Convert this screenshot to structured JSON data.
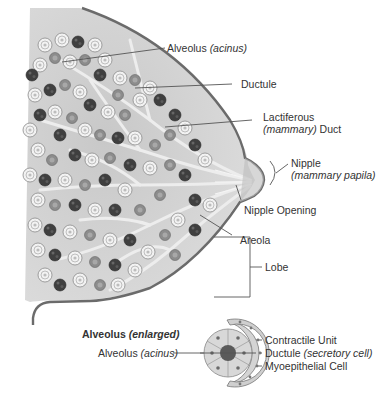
{
  "diagram": {
    "labels": {
      "alveolus": {
        "main": "Alveolus",
        "italic": "(acinus)"
      },
      "ductule": {
        "main": "Ductule"
      },
      "lactiferous": {
        "line1": "Lactiferous",
        "italic": "(mammary)",
        "line2_rest": " Duct"
      },
      "nipple": {
        "main": "Nipple",
        "italic": "(mammary papila)"
      },
      "nipple_opening": {
        "main": "Nipple Opening"
      },
      "areola": {
        "main": "Areola"
      },
      "lobe": {
        "main": "Lobe"
      }
    },
    "inset": {
      "title_bold": "Alveolus ",
      "title_italic": "(enlarged)",
      "left_label": {
        "main": "Alveolus ",
        "italic": "(acinus)"
      },
      "right_labels": [
        {
          "main": "Contractile Unit",
          "italic": ""
        },
        {
          "main": "Ductule ",
          "italic": "(secretory cell)"
        },
        {
          "main": "Myoepithelial Cell",
          "italic": ""
        }
      ]
    },
    "colors": {
      "outline": "#6b6b6b",
      "tissue_fill": "#d9d9d9",
      "dark_lobule": "#4a4a4a",
      "light_lobule": "#efefef",
      "duct": "#e8e8e8",
      "leader_line": "#555555"
    }
  }
}
